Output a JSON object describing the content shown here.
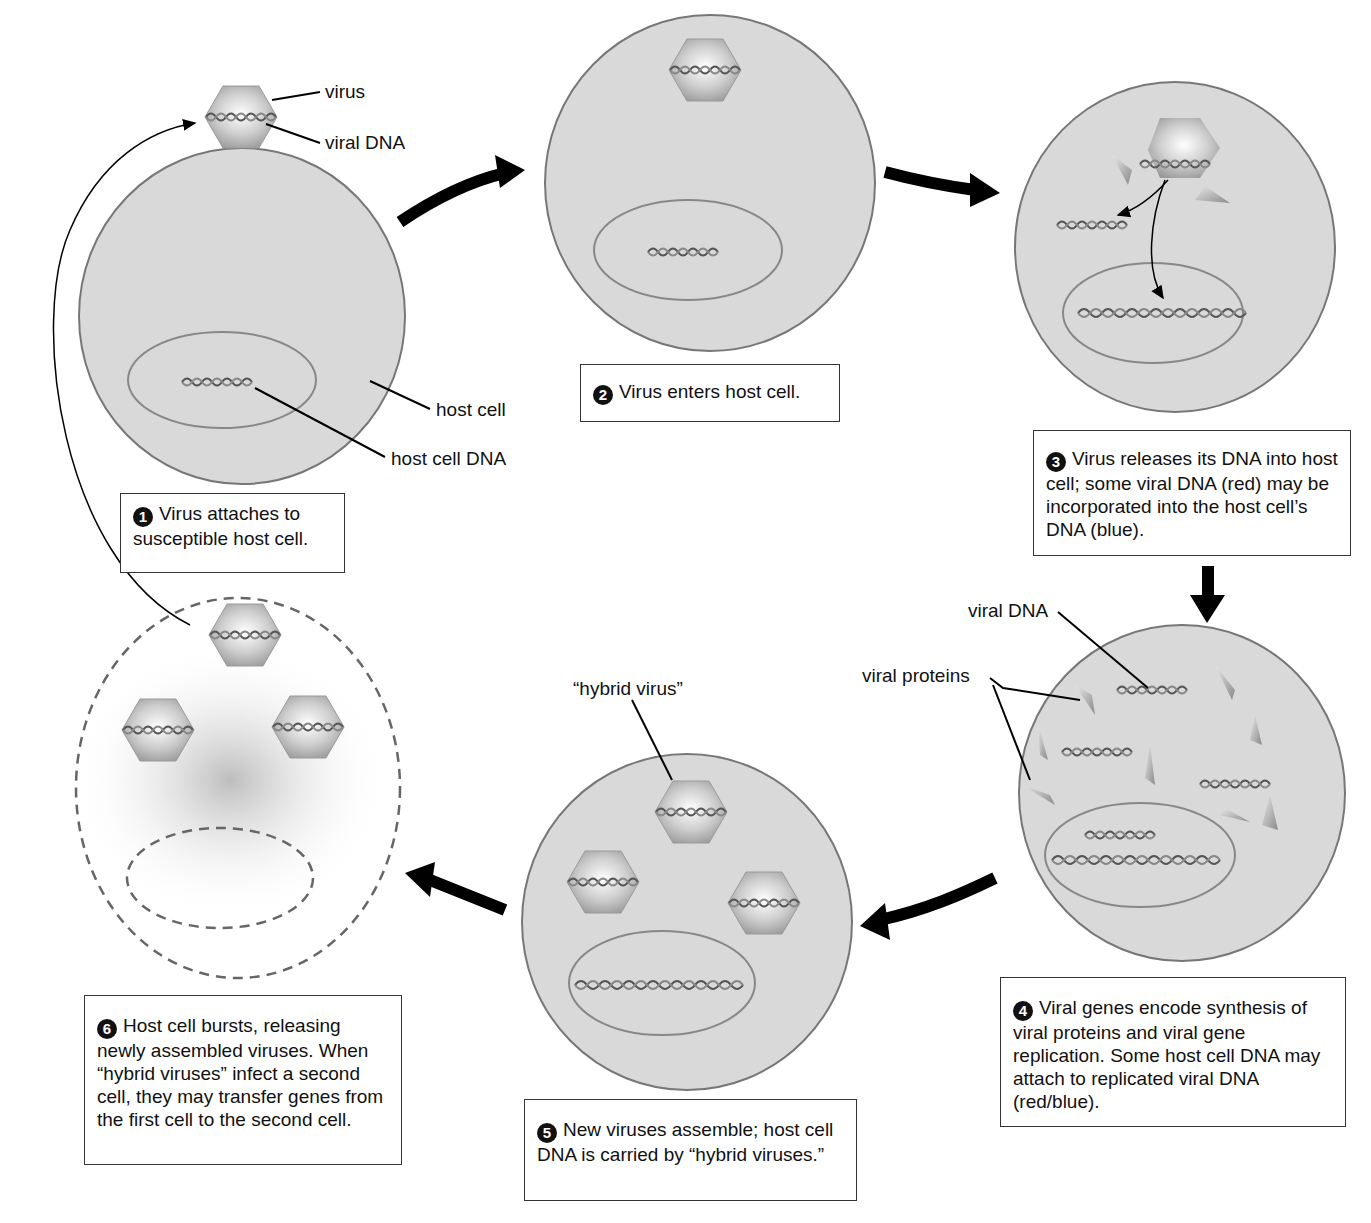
{
  "diagram": {
    "colors": {
      "cell_fill": "#d9d9d9",
      "cell_stroke": "#777777",
      "virus_fill": "#bdbdbd",
      "arrow": "#000000",
      "box_border": "#333333"
    }
  },
  "labels": {
    "virus": "virus",
    "viral_dna_top": "viral DNA",
    "host_cell": "host cell",
    "host_cell_dna": "host cell DNA",
    "viral_dna_step4": "viral DNA",
    "viral_proteins": "viral proteins",
    "hybrid_virus": "“hybrid virus”"
  },
  "steps": [
    {
      "number": "1",
      "text": "Virus attaches to susceptible host cell."
    },
    {
      "number": "2",
      "text": "Virus enters host cell."
    },
    {
      "number": "3",
      "text": "Virus releases its DNA into host cell; some viral DNA (red) may be incorporated into the host cell’s DNA (blue)."
    },
    {
      "number": "4",
      "text": "Viral genes encode synthesis of viral proteins and viral gene replication. Some host cell DNA may attach to replicated viral DNA (red/blue)."
    },
    {
      "number": "5",
      "text": "New viruses assemble; host cell DNA is carried by “hybrid viruses.”"
    },
    {
      "number": "6",
      "text": "Host cell bursts, releasing newly assembled viruses. When “hybrid viruses” infect a second cell, they may transfer genes from the first cell to the second cell."
    }
  ]
}
